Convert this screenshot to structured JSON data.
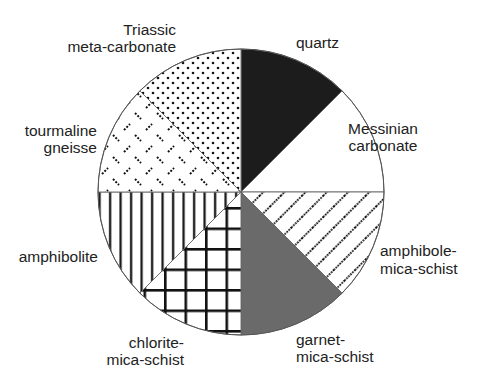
{
  "chart_data": {
    "type": "pie",
    "title": "",
    "start_angle_deg": 0,
    "direction": "clockwise",
    "center": [
      241,
      192
    ],
    "radius": 143,
    "categories": [
      "quartz",
      "Messinian carbonate",
      "amphibole-mica-schist",
      "garnet-mica-schist",
      "chlorite-mica-schist",
      "amphibolite",
      "tourmaline gneisse",
      "Triassic meta-carbonate"
    ],
    "values": [
      12.5,
      12.5,
      12.5,
      12.5,
      12.5,
      12.5,
      12.5,
      12.5
    ],
    "fills": [
      "solid-black",
      "white",
      "diagonal-dotted-lines",
      "solid-gray",
      "grid-crosshatch",
      "vertical-lines",
      "dashes",
      "dots"
    ],
    "legend": "none (direct labels)"
  },
  "labels": {
    "quartz": [
      "quartz"
    ],
    "messinian": [
      "Messinian",
      "carbonate"
    ],
    "amphibole": [
      "amphibole-",
      "mica-schist"
    ],
    "garnet": [
      "garnet-",
      "mica-schist"
    ],
    "chlorite": [
      "chlorite-",
      "mica-schist"
    ],
    "amphibolite": [
      "amphibolite"
    ],
    "tourmaline": [
      "tourmaline",
      "gneisse"
    ],
    "triassic": [
      "Triassic",
      "meta-carbonate"
    ]
  },
  "colors": {
    "quartz": "#1c1c1c",
    "garnet": "#6a6a6a",
    "outline": "#555555",
    "pattern": "#111111"
  }
}
